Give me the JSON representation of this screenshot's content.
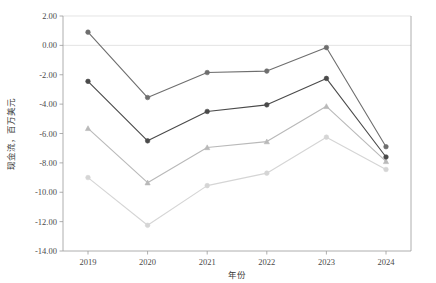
{
  "chart_data": {
    "type": "line",
    "title": "",
    "xlabel": "年份",
    "ylabel": "现金流，百万美元",
    "categories": [
      "2019",
      "2020",
      "2021",
      "2022",
      "2023",
      "2024"
    ],
    "x": [
      2019,
      2020,
      2021,
      2022,
      2023,
      2024
    ],
    "ylim": [
      -14.0,
      2.0
    ],
    "ytick_labels": [
      "2.00",
      "0.00",
      "-2.00",
      "-4.00",
      "-6.00",
      "-8.00",
      "-10.00",
      "-12.00",
      "-14.00"
    ],
    "yticks": [
      2.0,
      0.0,
      -2.0,
      -4.0,
      -6.0,
      -8.0,
      -10.0,
      -12.0,
      -14.0
    ],
    "grid": "horizontal-at-2.00-and-0.00",
    "legend": "none",
    "series": [
      {
        "name": "series-1",
        "color": "#6e6e6e",
        "marker": "circle",
        "values": [
          0.9,
          -3.55,
          -1.85,
          -1.75,
          -0.15,
          -6.9
        ]
      },
      {
        "name": "series-2",
        "color": "#4a4a4a",
        "marker": "circle",
        "values": [
          -2.45,
          -6.5,
          -4.5,
          -4.05,
          -2.25,
          -7.6
        ]
      },
      {
        "name": "series-3",
        "color": "#b9b9b9",
        "marker": "triangle",
        "values": [
          -5.65,
          -9.35,
          -6.95,
          -6.55,
          -4.15,
          -7.9
        ]
      },
      {
        "name": "series-4",
        "color": "#d5d5d5",
        "marker": "circle",
        "values": [
          -9.0,
          -12.25,
          -9.55,
          -8.7,
          -6.25,
          -8.45
        ]
      }
    ]
  }
}
